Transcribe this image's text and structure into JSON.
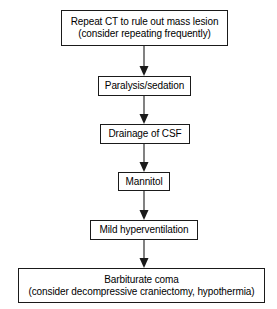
{
  "diagram": {
    "orientation": "vertical-top-to-bottom",
    "background_color": "#ffffff",
    "line_color": "#1a1a1a",
    "text_color": "#000000",
    "nodes": [
      {
        "id": "repeat-ct",
        "shape": "rectangle",
        "line1": "Repeat CT to rule out mass lesion",
        "line2": "(consider repeating frequently)"
      },
      {
        "id": "paralysis-sedation",
        "shape": "rectangle",
        "line1": "Paralysis/sedation",
        "line2": ""
      },
      {
        "id": "drainage-of-csf",
        "shape": "rectangle",
        "line1": "Drainage of CSF",
        "line2": ""
      },
      {
        "id": "mannitol",
        "shape": "rectangle",
        "line1": "Mannitol",
        "line2": ""
      },
      {
        "id": "mild-hyperventilation",
        "shape": "rectangle",
        "line1": "Mild hyperventilation",
        "line2": ""
      },
      {
        "id": "barbiturate-coma",
        "shape": "rectangle",
        "line1": "Barbiturate coma",
        "line2": "(consider decompressive craniectomy, hypothermia)"
      }
    ],
    "edges": [
      {
        "id": "edge-1",
        "from": "repeat-ct",
        "to": "paralysis-sedation",
        "style": "solid-arrow-down"
      },
      {
        "id": "edge-2",
        "from": "paralysis-sedation",
        "to": "drainage-of-csf",
        "style": "solid-arrow-down"
      },
      {
        "id": "edge-3",
        "from": "drainage-of-csf",
        "to": "mannitol",
        "style": "solid-arrow-down"
      },
      {
        "id": "edge-4",
        "from": "mannitol",
        "to": "mild-hyperventilation",
        "style": "solid-arrow-down"
      },
      {
        "id": "edge-5",
        "from": "mild-hyperventilation",
        "to": "barbiturate-coma",
        "style": "solid-arrow-down"
      }
    ]
  }
}
